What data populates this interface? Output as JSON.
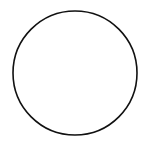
{
  "canvas": {
    "width": 150,
    "height": 148,
    "background": "#ffffff"
  },
  "shape": {
    "type": "circle",
    "cx": 75,
    "cy": 73,
    "r": 62,
    "stroke": "#111111",
    "stroke_width": 1.6,
    "fill": "none"
  }
}
